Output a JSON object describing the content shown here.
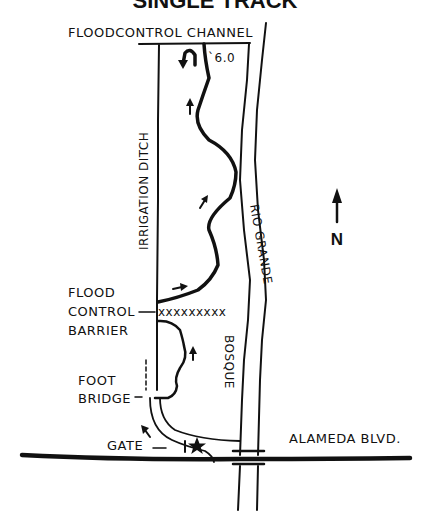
{
  "map": {
    "title": "SINGLE TRACK",
    "labels": {
      "flood_control_channel": "FLOODCONTROL CHANNEL",
      "irrigation_ditch": "IRRIGATION DITCH",
      "rio_grande": "RIO GRANDE",
      "bosque": "BOSQUE",
      "flood_control_barrier_line1": "FLOOD",
      "flood_control_barrier_line2": "CONTROL",
      "flood_control_barrier_line3": "BARRIER",
      "foot_bridge_line1": "FOOT",
      "foot_bridge_line2": "BRIDGE",
      "gate": "GATE",
      "alameda_blvd": "ALAMEDA BLVD.",
      "distance": "`6.0",
      "north": "N"
    },
    "barrier_marks": "xxxxxxxxx",
    "colors": {
      "ink": "#111111",
      "background": "#ffffff"
    }
  }
}
